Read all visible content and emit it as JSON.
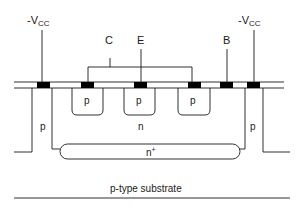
{
  "diagram": {
    "terminals": {
      "vcc_left": "-V",
      "vcc_left_sub": "CC",
      "collector": "C",
      "emitter": "E",
      "base": "B",
      "vcc_right": "-V",
      "vcc_right_sub": "CC"
    },
    "regions": {
      "p_well_1": "p",
      "p_well_2": "p",
      "p_well_3": "p",
      "n_epi": "n",
      "isolation_left": "p",
      "isolation_right": "p",
      "buried_layer": "n",
      "buried_layer_sup": "+",
      "substrate": "p-type substrate"
    },
    "colors": {
      "line": "#1a1a1a",
      "contact": "#000000",
      "background": "#ffffff"
    }
  }
}
